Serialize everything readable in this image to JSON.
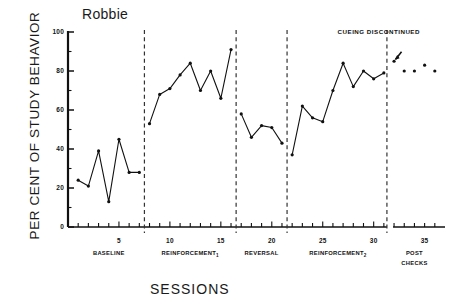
{
  "chart_data": {
    "type": "line",
    "title": "Robbie",
    "xlabel": "SESSIONS",
    "ylabel": "PER CENT OF STUDY BEHAVIOR",
    "ylim": [
      0,
      100
    ],
    "xlim": [
      0,
      37
    ],
    "grid": false,
    "legend": null,
    "ytick_labels": [
      "0",
      "20",
      "40",
      "60",
      "80",
      "100"
    ],
    "ytick_values": [
      0,
      20,
      40,
      60,
      80,
      100
    ],
    "xtick_labels": [
      "5",
      "10",
      "15",
      "20",
      "25",
      "30",
      "35"
    ],
    "xtick_values": [
      5,
      10,
      15,
      20,
      25,
      30,
      35
    ],
    "series": [
      {
        "name": "Baseline",
        "x": [
          1,
          2,
          3,
          4,
          5,
          6,
          7
        ],
        "values": [
          24,
          21,
          39,
          13,
          45,
          28,
          28
        ],
        "connected": true
      },
      {
        "name": "Reinforcement 1",
        "x": [
          8,
          9,
          10,
          11,
          12,
          13,
          14,
          15,
          16
        ],
        "values": [
          53,
          68,
          71,
          78,
          84,
          70,
          80,
          66,
          91
        ],
        "connected": true
      },
      {
        "name": "Reversal",
        "x": [
          17,
          18,
          19,
          20,
          21
        ],
        "values": [
          58,
          46,
          52,
          51,
          43
        ],
        "connected": true
      },
      {
        "name": "Reinforcement 2",
        "x": [
          22,
          23,
          24,
          25,
          26,
          27,
          28,
          29,
          30,
          31
        ],
        "values": [
          37,
          62,
          56,
          54,
          70,
          84,
          72,
          80,
          76,
          79
        ],
        "connected": true
      },
      {
        "name": "Post Checks",
        "x": [
          32,
          33,
          34,
          35,
          36
        ],
        "values": [
          85,
          80,
          80,
          83,
          80
        ],
        "connected": false
      }
    ],
    "phase_dividers": [
      7.5,
      16.5,
      21.5,
      31.3
    ],
    "phases": [
      {
        "label": "BASELINE",
        "sub": "",
        "center_x": 4
      },
      {
        "label": "REINFORCEMENT",
        "sub": "1",
        "center_x": 12
      },
      {
        "label": "REVERSAL",
        "sub": "",
        "center_x": 19
      },
      {
        "label": "REINFORCEMENT",
        "sub": "2",
        "center_x": 26.5
      },
      {
        "label": "POST",
        "sub": "",
        "center_x": 34
      }
    ],
    "phase_label_second_line": "CHECKS",
    "annotations": [
      {
        "text": "CUEING DISCONTINUED",
        "x": 30.5,
        "y": 99,
        "arrow_to_x": 32,
        "arrow_to_y": 85
      }
    ],
    "colors": {
      "line": "#111111",
      "marker": "#111111",
      "axis": "#111111",
      "divider": "#333333",
      "background": "#ffffff"
    }
  }
}
